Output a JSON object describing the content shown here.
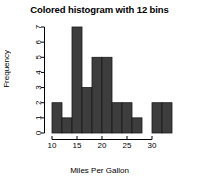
{
  "chart_data": {
    "type": "bar",
    "title": "Colored histogram with 12 bins",
    "xlabel": "Miles Per Gallon",
    "ylabel": "Frequency",
    "bin_edges": [
      10,
      12,
      14,
      16,
      18,
      20,
      22,
      24,
      26,
      28,
      30,
      32,
      34
    ],
    "categories": [
      "10-12",
      "12-14",
      "14-16",
      "16-18",
      "18-20",
      "20-22",
      "22-24",
      "24-26",
      "26-28",
      "28-30",
      "30-32",
      "32-34"
    ],
    "values": [
      2,
      1,
      7,
      3,
      5,
      5,
      2,
      2,
      1,
      0,
      2,
      2
    ],
    "bar_color": "#3d3d3d",
    "bar_border_color": "#1a1a1a",
    "xlim": [
      10,
      34
    ],
    "ylim": [
      0,
      7
    ],
    "xticks": [
      10,
      15,
      20,
      25,
      30
    ],
    "xtick_labels": [
      "10",
      "15",
      "20",
      "25",
      "30"
    ],
    "yticks": [
      0,
      1,
      2,
      3,
      4,
      5,
      6,
      7
    ],
    "ytick_labels": [
      "0",
      "1",
      "2",
      "3",
      "4",
      "5",
      "6",
      "7"
    ],
    "ytick_label_rotation": 90,
    "grid": false,
    "legend": null,
    "axis_color": "#000000",
    "background": "#ffffff"
  }
}
